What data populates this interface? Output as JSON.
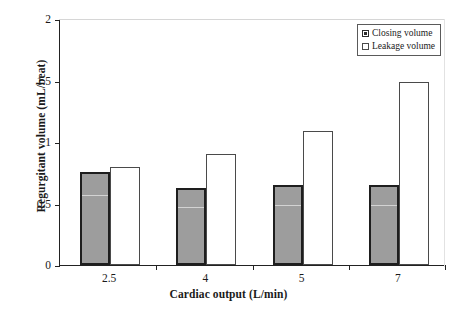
{
  "chart_data": {
    "type": "bar",
    "title": "",
    "xlabel": "Cardiac output (L/min)",
    "ylabel": "Regurgitant volume (mL/beat)",
    "categories": [
      "2.5",
      "4",
      "5",
      "7"
    ],
    "series": [
      {
        "name": "Closing volume",
        "values": [
          0.76,
          0.63,
          0.65,
          0.65
        ],
        "color": "#9d9d9d"
      },
      {
        "name": "Leakage volume",
        "values": [
          0.8,
          0.9,
          1.09,
          1.49
        ],
        "color": "#ffffff"
      }
    ],
    "ylim": [
      0,
      2
    ],
    "yticks": [
      0,
      0.5,
      1,
      1.5,
      2
    ],
    "ytick_labels": [
      "0",
      "0.5",
      "1",
      "1.5",
      "2"
    ],
    "grid": false,
    "legend_position": "top-right"
  },
  "legend": {
    "items": [
      {
        "label": "Closing volume",
        "swatch": "filled-square-icon"
      },
      {
        "label": "Leakage volume",
        "swatch": "empty-square-icon"
      }
    ]
  }
}
